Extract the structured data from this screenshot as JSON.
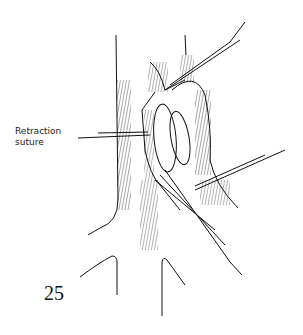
{
  "figure": {
    "number": "25",
    "annotation_line1": "Retraction",
    "annotation_line2": "suture",
    "colors": {
      "ink": "#111111",
      "background": "#ffffff"
    }
  }
}
